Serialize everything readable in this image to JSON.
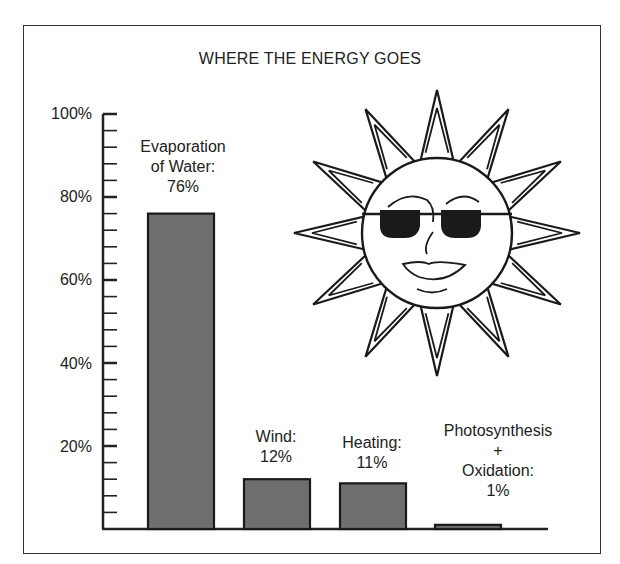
{
  "chart_data": {
    "type": "bar",
    "title": "WHERE THE ENERGY GOES",
    "xlabel": "",
    "ylabel": "",
    "ylim": [
      0,
      100
    ],
    "yticks": [
      "20%",
      "40%",
      "60%",
      "80%",
      "100%"
    ],
    "minor_tick_step": 4,
    "grid": false,
    "legend": null,
    "categories": [
      "Evaporation of Water",
      "Wind",
      "Heating",
      "Photosynthesis + Oxidation"
    ],
    "values": [
      76,
      12,
      11,
      1
    ],
    "bar_labels": [
      "Evaporation\nof Water:\n76%",
      "Wind:\n12%",
      "Heating:\n11%",
      "Photosynthesis\n+\nOxidation:\n1%"
    ],
    "bar_color": "#6e6e6e",
    "decoration": "sun-with-sunglasses-illustration"
  }
}
